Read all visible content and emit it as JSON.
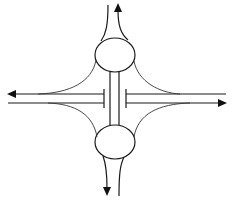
{
  "diagram": {
    "type": "interchange-schematic",
    "colors": {
      "stroke": "#1a1a1a",
      "background": "#ffffff"
    },
    "elements": {
      "roundabouts": [
        {
          "name": "north-roundabout",
          "cx": 115,
          "cy": 55,
          "rx": 20,
          "ry": 17
        },
        {
          "name": "south-roundabout",
          "cx": 115,
          "cy": 142,
          "rx": 20,
          "ry": 17
        }
      ],
      "mainline": {
        "westbound": {
          "y": 94,
          "direction": "left"
        },
        "eastbound": {
          "y": 103,
          "direction": "right"
        }
      },
      "arrows": [
        "north",
        "west",
        "east",
        "south"
      ]
    }
  }
}
